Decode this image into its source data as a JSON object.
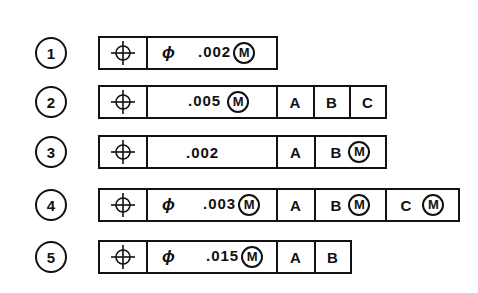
{
  "rows": [
    {
      "number": "1",
      "diameter": "ϕ",
      "tolerance": ".002",
      "modifier": "M",
      "datums": []
    },
    {
      "number": "2",
      "diameter": "",
      "tolerance": ".005",
      "modifier": "M",
      "datums": [
        {
          "label": "A",
          "modifier": ""
        },
        {
          "label": "B",
          "modifier": ""
        },
        {
          "label": "C",
          "modifier": ""
        }
      ]
    },
    {
      "number": "3",
      "diameter": "",
      "tolerance": ".002",
      "modifier": "",
      "datums": [
        {
          "label": "A",
          "modifier": ""
        },
        {
          "label": "B",
          "modifier": "M"
        }
      ]
    },
    {
      "number": "4",
      "diameter": "ϕ",
      "tolerance": ".003",
      "modifier": "M",
      "datums": [
        {
          "label": "A",
          "modifier": ""
        },
        {
          "label": "B",
          "modifier": "M"
        },
        {
          "label": "C",
          "modifier": "M"
        }
      ]
    },
    {
      "number": "5",
      "diameter": "ϕ",
      "tolerance": ".015",
      "modifier": "M",
      "datums": [
        {
          "label": "A",
          "modifier": ""
        },
        {
          "label": "B",
          "modifier": ""
        }
      ]
    }
  ],
  "symbol": "position-icon"
}
